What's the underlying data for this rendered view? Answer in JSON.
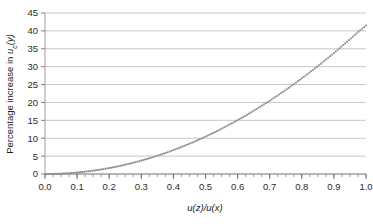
{
  "chart_data": {
    "type": "line",
    "title": "",
    "subtitle": "",
    "xlabel": "u(z)/u(x)",
    "ylabel": "Percentage increase in u_c(y)",
    "ylabel_parts": {
      "prefix": "Percentage increase in ",
      "var": "u",
      "subscript": "c",
      "suffix": "(y)"
    },
    "xlabel_parts": {
      "numer_var": "u",
      "numer_arg": "(z)",
      "slash": "/",
      "denom_var": "u",
      "denom_arg": "(x)"
    },
    "xlim": [
      0.0,
      1.0
    ],
    "ylim": [
      0,
      45
    ],
    "xticks": [
      0.0,
      0.1,
      0.2,
      0.3,
      0.4,
      0.5,
      0.6,
      0.7,
      0.8,
      0.9,
      1.0
    ],
    "xticklabels": [
      "0.0",
      "0.1",
      "0.2",
      "0.3",
      "0.4",
      "0.5",
      "0.6",
      "0.7",
      "0.8",
      "0.9",
      "1.0"
    ],
    "yticks": [
      0,
      5,
      10,
      15,
      20,
      25,
      30,
      35,
      40,
      45
    ],
    "yticklabels": [
      "0",
      "5",
      "10",
      "15",
      "20",
      "25",
      "30",
      "35",
      "40",
      "45"
    ],
    "x_minor_tick_step": 0.025,
    "grid": {
      "horizontal": true,
      "vertical": false,
      "color": "#c8c8c8"
    },
    "legend": {
      "visible": false,
      "position": "none"
    },
    "series": [
      {
        "name": "Percentage increase in u_c(y)",
        "style": "dotted",
        "color": "#8c8c8c",
        "marker": "square-dot",
        "x": [
          0.0,
          0.02,
          0.04,
          0.06,
          0.08,
          0.1,
          0.12,
          0.14,
          0.16,
          0.18,
          0.2,
          0.22,
          0.24,
          0.26,
          0.28,
          0.3,
          0.32,
          0.34,
          0.36,
          0.38,
          0.4,
          0.42,
          0.44,
          0.46,
          0.48,
          0.5,
          0.52,
          0.54,
          0.56,
          0.58,
          0.6,
          0.62,
          0.64,
          0.66,
          0.68,
          0.7,
          0.72,
          0.74,
          0.76,
          0.78,
          0.8,
          0.82,
          0.84,
          0.86,
          0.88,
          0.9,
          0.92,
          0.94,
          0.96,
          0.98,
          1.0
        ],
        "y": [
          0.0,
          0.02,
          0.07,
          0.15,
          0.27,
          0.41,
          0.6,
          0.81,
          1.06,
          1.34,
          1.66,
          2.01,
          2.39,
          2.81,
          3.26,
          3.75,
          4.27,
          4.82,
          5.41,
          6.03,
          6.68,
          7.37,
          8.09,
          8.84,
          9.63,
          10.45,
          11.3,
          12.19,
          13.11,
          14.06,
          15.05,
          16.07,
          17.12,
          18.21,
          19.33,
          20.48,
          21.66,
          22.88,
          24.13,
          25.42,
          26.73,
          28.08,
          29.47,
          30.88,
          32.33,
          33.81,
          35.33,
          36.88,
          38.46,
          40.07,
          41.5
        ]
      }
    ],
    "plot_area": {
      "left": 45,
      "top": 13,
      "right": 366,
      "bottom": 174
    },
    "colors": {
      "curve": "#8c8c8c",
      "gridline": "#c8c8c8",
      "axis": "#808080",
      "text": "#2b2b2b",
      "background": "#ffffff"
    }
  }
}
